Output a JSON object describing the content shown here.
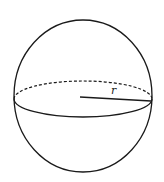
{
  "diagram": {
    "shape": "sphere",
    "labels": {
      "radius": "r"
    },
    "colors": {
      "stroke": "#1a1a1a",
      "background": "#ffffff"
    }
  }
}
